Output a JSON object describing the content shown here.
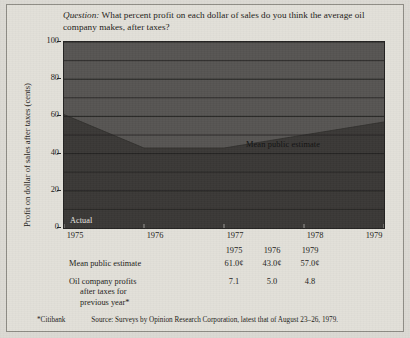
{
  "question": {
    "prefix": "Question:",
    "text": " What percent profit on each dollar of sales do you think the average oil company makes, after taxes?"
  },
  "chart_data": {
    "type": "area",
    "title": "",
    "xlabel": "",
    "ylabel": "Profit on dollar of sales after taxes (cents)",
    "x": [
      1975,
      1976,
      1977,
      1979
    ],
    "xtick_labels": [
      "1975",
      "1976",
      "1977",
      "1978",
      "1979"
    ],
    "xlim": [
      1975,
      1979
    ],
    "ylim": [
      0,
      100
    ],
    "ytick_labels": [
      "0",
      "20",
      "40",
      "60",
      "80",
      "100"
    ],
    "ytick_values": [
      0,
      20,
      40,
      60,
      80,
      100
    ],
    "grid": true,
    "gridline_values": [
      10,
      20,
      30,
      40,
      50,
      60,
      70,
      80,
      90,
      100
    ],
    "series": [
      {
        "name": "Mean public estimate",
        "values": [
          61.0,
          43.0,
          43.0,
          57.0
        ],
        "label": "Mean public estimate",
        "fill_color": "#3a3836",
        "upper_fill_color": "#565452"
      }
    ],
    "annotations": [
      {
        "name": "actual",
        "text": "Actual"
      },
      {
        "name": "mean-public-estimate",
        "text": "Mean public estimate"
      }
    ],
    "colors": {
      "plot_background": "#565452",
      "estimate_fill": "#3a3836",
      "gridline": "#232221",
      "page_background": "#e2e0d9",
      "text": "#1d1b18"
    }
  },
  "table": {
    "year_headers": [
      "1975",
      "1976",
      "1979"
    ],
    "rows": [
      {
        "label": "Mean public estimate",
        "label_cont": "",
        "label_cont2": "",
        "values": [
          "61.0¢",
          "43.0¢",
          "57.0¢"
        ]
      },
      {
        "label": "Oil company profits",
        "label_cont": "after taxes for",
        "label_cont2": "previous year*",
        "values": [
          "7.1",
          "5.0",
          "4.8"
        ]
      }
    ]
  },
  "footer": {
    "note": "*Citibank",
    "source": "Source: Surveys by Opinion Research Corporation, latest that of August 23–26, 1979."
  }
}
